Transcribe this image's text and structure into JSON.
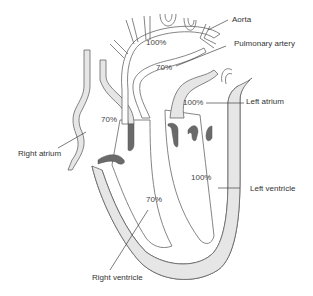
{
  "diagram": {
    "type": "heart-blood-flow-oxygen-saturation",
    "colors": {
      "tissue_fill": "#e6e6e6",
      "outline": "#666666",
      "valve": "#6a6a6a",
      "text": "#333333"
    },
    "labels": {
      "aorta": "Aorta",
      "pulmonary_artery": "Pulmonary artery",
      "left_atrium": "Left atrium",
      "right_atrium": "Right atrium",
      "left_ventricle": "Left ventricle",
      "right_ventricle": "Right ventricle"
    },
    "saturations": {
      "aorta": "100%",
      "pulmonary_artery": "70%",
      "left_atrium": "100%",
      "right_atrium": "70%",
      "left_ventricle": "100%",
      "right_ventricle": "70%"
    }
  }
}
